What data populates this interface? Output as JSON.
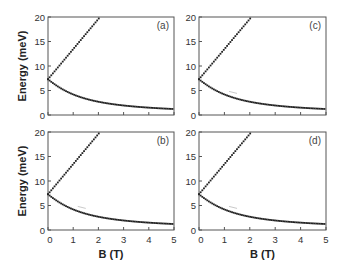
{
  "chart_data": [
    {
      "type": "scatter",
      "panel": "(a)",
      "title": "",
      "xlabel": "",
      "ylabel": "Energy (meV)",
      "xlim": [
        0,
        5
      ],
      "ylim": [
        0,
        20
      ],
      "xticks": [
        0,
        1,
        2,
        3,
        4,
        5
      ],
      "yticks": [
        0,
        5,
        10,
        15,
        20
      ],
      "grid": false,
      "series": [
        {
          "name": "upper branch",
          "x": [
            0,
            0.5,
            1.0,
            1.5,
            2.0,
            2.04
          ],
          "values": [
            7.3,
            11.8,
            16.0,
            18.8,
            19.7,
            20.0
          ]
        },
        {
          "name": "lower branch",
          "x": [
            0,
            0.5,
            1.0,
            1.5,
            2.0,
            3.0,
            4.0,
            5.0
          ],
          "values": [
            7.3,
            5.3,
            3.9,
            3.0,
            2.7,
            1.9,
            1.5,
            1.2
          ]
        }
      ]
    },
    {
      "type": "scatter",
      "panel": "(b)",
      "xlabel": "B (T)",
      "ylabel": "Energy (meV)",
      "xlim": [
        0,
        5
      ],
      "ylim": [
        0,
        20
      ],
      "xticks": [
        0,
        1,
        2,
        3,
        4,
        5
      ],
      "yticks": [
        0,
        5,
        10,
        15,
        20
      ],
      "grid": false,
      "annotations": [
        "small anticrossing near B≈1.3 T, E≈4 meV"
      ],
      "series": [
        {
          "name": "upper branch",
          "x": [
            0,
            0.5,
            1.0,
            1.5,
            2.0,
            2.04
          ],
          "values": [
            7.3,
            11.8,
            16.0,
            18.8,
            19.7,
            20.0
          ]
        },
        {
          "name": "lower branch",
          "x": [
            0,
            0.5,
            1.0,
            1.5,
            2.0,
            3.0,
            4.0,
            5.0
          ],
          "values": [
            7.3,
            5.3,
            3.9,
            3.0,
            2.7,
            1.9,
            1.5,
            1.2
          ]
        }
      ]
    },
    {
      "type": "scatter",
      "panel": "(c)",
      "xlabel": "",
      "ylabel": "",
      "xlim": [
        0,
        5
      ],
      "ylim": [
        0,
        20
      ],
      "xticks": [
        0,
        1,
        2,
        3,
        4,
        5
      ],
      "yticks": [
        0,
        5,
        10,
        15,
        20
      ],
      "grid": false,
      "annotations": [
        "small anticrossing near B≈1.3 T, E≈4 meV"
      ],
      "series": [
        {
          "name": "upper branch",
          "x": [
            0,
            0.5,
            1.0,
            1.5,
            2.0,
            2.04
          ],
          "values": [
            7.3,
            11.8,
            16.0,
            18.8,
            19.7,
            20.0
          ]
        },
        {
          "name": "lower branch",
          "x": [
            0,
            0.5,
            1.0,
            1.5,
            2.0,
            3.0,
            4.0,
            5.0
          ],
          "values": [
            7.3,
            5.3,
            3.9,
            3.0,
            2.7,
            1.9,
            1.5,
            1.2
          ]
        }
      ]
    },
    {
      "type": "scatter",
      "panel": "(d)",
      "xlabel": "B (T)",
      "ylabel": "",
      "xlim": [
        0,
        5
      ],
      "ylim": [
        0,
        20
      ],
      "xticks": [
        0,
        1,
        2,
        3,
        4,
        5
      ],
      "yticks": [
        0,
        5,
        10,
        15,
        20
      ],
      "grid": false,
      "annotations": [
        "small anticrossing near B≈1.3 T, E≈4 meV"
      ],
      "series": [
        {
          "name": "upper branch",
          "x": [
            0,
            0.5,
            1.0,
            1.5,
            2.0,
            2.04
          ],
          "values": [
            7.3,
            11.8,
            16.0,
            18.8,
            19.7,
            20.0
          ]
        },
        {
          "name": "lower branch",
          "x": [
            0,
            0.5,
            1.0,
            1.5,
            2.0,
            3.0,
            4.0,
            5.0
          ],
          "values": [
            7.3,
            5.3,
            3.9,
            3.0,
            2.7,
            1.9,
            1.5,
            1.2
          ]
        }
      ]
    }
  ],
  "model": {
    "E0": 7.3,
    "k": 4.25,
    "dot_step_B": 0.065
  },
  "panels": [
    {
      "id": "a",
      "label": "(a)",
      "x0": 48,
      "y0": 17,
      "x1": 174,
      "y1": 115,
      "show_xticklabels": false,
      "show_ylabel": true,
      "gap": false
    },
    {
      "id": "c",
      "label": "(c)",
      "x0": 199,
      "y0": 17,
      "x1": 326,
      "y1": 115,
      "show_xticklabels": false,
      "show_ylabel": false,
      "gap": true
    },
    {
      "id": "b",
      "label": "(b)",
      "x0": 48,
      "y0": 132,
      "x1": 174,
      "y1": 230,
      "show_xticklabels": true,
      "show_ylabel": true,
      "gap": true
    },
    {
      "id": "d",
      "label": "(d)",
      "x0": 199,
      "y0": 132,
      "x1": 326,
      "y1": 230,
      "show_xticklabels": true,
      "show_ylabel": false,
      "gap": true
    }
  ],
  "axes": {
    "ylabel": "Energy (meV)",
    "xlabel": "B (T)",
    "ytick_labels": [
      "0",
      "5",
      "10",
      "15",
      "20"
    ],
    "xtick_labels": [
      "0",
      "1",
      "2",
      "3",
      "4",
      "5"
    ]
  },
  "colors": {
    "dots": "#222222",
    "frame": "#555555",
    "gap": "#bbbbbb"
  }
}
